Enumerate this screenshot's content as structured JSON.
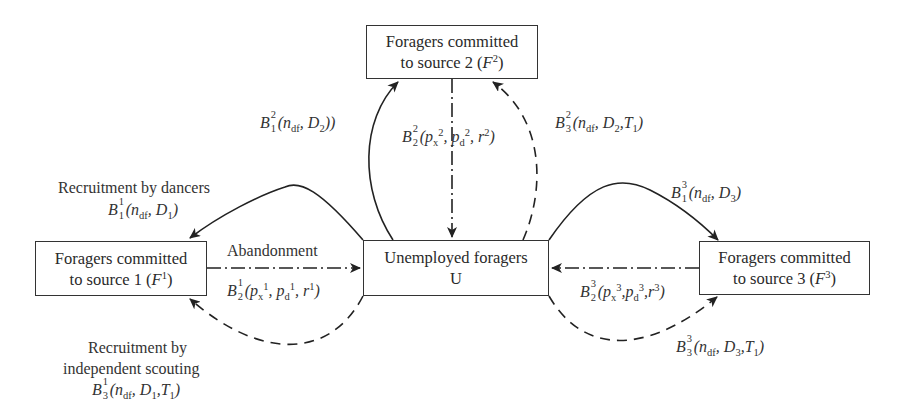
{
  "diagram": {
    "type": "state-transition",
    "nodes": {
      "f2": {
        "line1": "Foragers committed",
        "line2_prefix": "to source 2 (",
        "symbol": "F",
        "sup": "2",
        "line2_suffix": ")"
      },
      "f1": {
        "line1": "Foragers committed",
        "line2_prefix": "to source 1 (",
        "symbol": "F",
        "sup": "1",
        "line2_suffix": ")"
      },
      "u": {
        "line1": "Unemployed foragers",
        "line2": "U"
      },
      "f3": {
        "line1": "Foragers committed",
        "line2_prefix": "to source 3 (",
        "symbol": "F",
        "sup": "3",
        "line2_suffix": ")"
      }
    },
    "edges": {
      "b12": {
        "from": "U",
        "to": "F2",
        "style": "solid",
        "B": "B",
        "sup": "2",
        "sub": "1",
        "args": "(n",
        "args_sub": "df",
        "args_rest": ", D",
        "d_sub": "2",
        "close": "))"
      },
      "b22": {
        "from": "F2",
        "to": "U",
        "style": "dash-dot",
        "B": "B",
        "sup": "2",
        "sub": "2",
        "p1": "(p",
        "p1_sub": "x",
        "p1_sup": "2",
        "p2": ", p",
        "p2_sub": "d",
        "p2_sup": "2",
        "r": ", r",
        "r_sup": "2",
        "close": ")"
      },
      "b32": {
        "from": "U",
        "to": "F2",
        "style": "dashed",
        "B": "B",
        "sup": "2",
        "sub": "3",
        "args": "(n",
        "args_sub": "df",
        "args_rest": ", D",
        "d_sub": "2",
        "t": ",T",
        "t_sub": "1",
        "close": ")"
      },
      "b11": {
        "from": "U",
        "to": "F1",
        "style": "solid",
        "title": "Recruitment by dancers",
        "B": "B",
        "sup": "1",
        "sub": "1",
        "args": "(n",
        "args_sub": "df",
        "args_rest": ", D",
        "d_sub": "1",
        "close": ")"
      },
      "b21": {
        "from": "F1",
        "to": "U",
        "style": "dash-dot",
        "title": "Abandonment",
        "B": "B",
        "sup": "1",
        "sub": "2",
        "p1": "(p",
        "p1_sub": "x",
        "p1_sup": "1",
        "p2": ", p",
        "p2_sub": "d",
        "p2_sup": "1",
        "r": ", r",
        "r_sup": "1",
        "close": ")"
      },
      "b31": {
        "from": "U",
        "to": "F1",
        "style": "dashed",
        "title1": "Recruitment by",
        "title2": "independent scouting",
        "B": "B",
        "sup": "1",
        "sub": "3",
        "args": "(n",
        "args_sub": "df",
        "args_rest": ", D",
        "d_sub": "1",
        "t": ",T",
        "t_sub": "1",
        "close": ")"
      },
      "b13": {
        "from": "U",
        "to": "F3",
        "style": "solid",
        "B": "B",
        "sup": "3",
        "sub": "1",
        "args": "(n",
        "args_sub": "df",
        "args_rest": ", D",
        "d_sub": "3",
        "close": ")"
      },
      "b23": {
        "from": "F3",
        "to": "U",
        "style": "dash-dot",
        "B": "B",
        "sup": "3",
        "sub": "2",
        "p1": "(p",
        "p1_sub": "x",
        "p1_sup": "3",
        "p2": ",p",
        "p2_sub": "d",
        "p2_sup": "3",
        "r": ",r",
        "r_sup": "3",
        "close": ")"
      },
      "b33": {
        "from": "U",
        "to": "F3",
        "style": "dashed",
        "B": "B",
        "sup": "3",
        "sub": "3",
        "args": "(n",
        "args_sub": "df",
        "args_rest": ", D",
        "d_sub": "3",
        "t": ",T",
        "t_sub": "1",
        "close": ")"
      }
    },
    "colors": {
      "line": "#222222",
      "text": "#333333",
      "background": "#ffffff"
    }
  }
}
